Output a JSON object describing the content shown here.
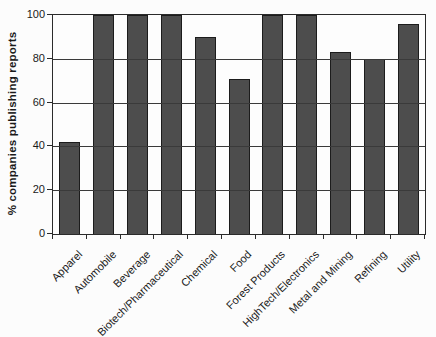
{
  "chart_data": {
    "type": "bar",
    "title": "",
    "xlabel": "",
    "ylabel": "% companies publishing reports",
    "categories": [
      "Apparel",
      "Automobile",
      "Beverage",
      "Biotech/Pharmaceutical",
      "Chemical",
      "Food",
      "Forest Products",
      "HighTech/Electronics",
      "Metal and Mining",
      "Refining",
      "Utility"
    ],
    "values": [
      42,
      100,
      100,
      100,
      90,
      71,
      100,
      100,
      83,
      80,
      96
    ],
    "ylim": [
      0,
      100
    ],
    "yticks": [
      0,
      20,
      40,
      60,
      80,
      100
    ],
    "grid": true,
    "legend_position": "none",
    "bar_color": "#4d4d4d",
    "bar_border_color": "#1c1c1c",
    "axis_color": "#2b2b2b",
    "gridline_color": "#3a3a3a",
    "text_color": "#1a1a1a",
    "background": "#fcfcfc"
  }
}
